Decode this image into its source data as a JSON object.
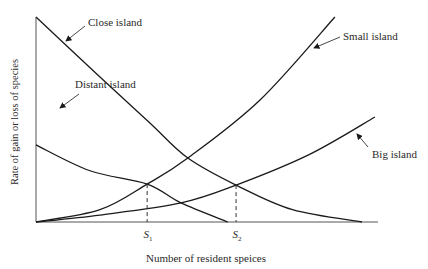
{
  "chart_data": {
    "type": "line",
    "title": "",
    "xlabel": "Number of resident speices",
    "ylabel": "Rate of gain or loss of species",
    "xlim": [
      0,
      100
    ],
    "ylim": [
      0,
      100
    ],
    "grid": false,
    "series": [
      {
        "name": "Close island",
        "kind": "immigration",
        "points": [
          [
            0,
            100
          ],
          [
            18.7,
            70.7
          ],
          [
            33.3,
            48.3
          ],
          [
            44.4,
            31.2
          ],
          [
            58.5,
            18.0
          ],
          [
            75,
            6
          ],
          [
            95.3,
            0
          ]
        ]
      },
      {
        "name": "Distant island",
        "kind": "immigration",
        "points": [
          [
            0,
            37.6
          ],
          [
            15.8,
            25
          ],
          [
            32.5,
            18.5
          ],
          [
            42.4,
            9.3
          ],
          [
            56.1,
            0
          ]
        ]
      },
      {
        "name": "Small island",
        "kind": "extinction",
        "points": [
          [
            0,
            0
          ],
          [
            18.7,
            6
          ],
          [
            32.5,
            18.5
          ],
          [
            44.4,
            31.2
          ],
          [
            65.5,
            59.5
          ],
          [
            87.4,
            100
          ]
        ]
      },
      {
        "name": "Big island",
        "kind": "extinction",
        "points": [
          [
            0,
            0
          ],
          [
            18.7,
            3.4
          ],
          [
            42.4,
            9.3
          ],
          [
            58.5,
            18.0
          ],
          [
            80,
            33
          ],
          [
            99.1,
            51.2
          ]
        ]
      }
    ],
    "equilibria": [
      {
        "label": "S",
        "sub": "1",
        "x": 32.5,
        "y": 18.5
      },
      {
        "label": "S",
        "sub": "2",
        "x": 58.5,
        "y": 18.0
      }
    ],
    "annotations": [
      {
        "text": "Close island",
        "target": "Close island"
      },
      {
        "text": "Distant island",
        "target": "Distant island"
      },
      {
        "text": "Small island",
        "target": "Small island"
      },
      {
        "text": "Big island",
        "target": "Big island"
      }
    ]
  }
}
